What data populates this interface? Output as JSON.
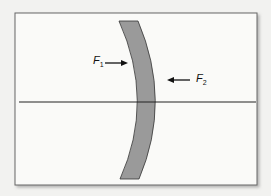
{
  "diagram": {
    "labels": {
      "f1": {
        "main": "F",
        "sub": "1"
      },
      "f2": {
        "main": "F",
        "sub": "2"
      }
    },
    "colors": {
      "background": "#f2f2f0",
      "frame_fill": "#fafaf8",
      "frame_border": "#555555",
      "lens_fill": "#9a9a9a",
      "line": "#222222"
    }
  }
}
